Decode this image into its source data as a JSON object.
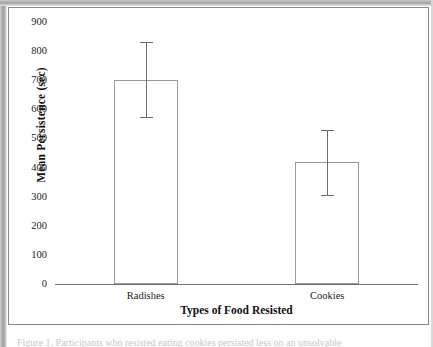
{
  "figure": {
    "caption_clipped": "Figure 1. Participants who resisted eating cookies persisted less on an unsolvable"
  },
  "chart_data": {
    "type": "bar",
    "title": "",
    "xlabel": "Types of Food Resisted",
    "ylabel": "Mean Persistence (sec)",
    "categories": [
      "Radishes",
      "Cookies"
    ],
    "values": [
      700,
      420
    ],
    "errors_low": [
      575,
      305
    ],
    "errors_high": [
      830,
      530
    ],
    "ylim": [
      0,
      900
    ],
    "ytick_values": [
      900,
      800,
      700,
      600,
      500,
      400,
      300,
      200,
      100,
      0
    ],
    "ytick_labels": [
      "900",
      "800",
      "700",
      "600",
      "500",
      "400",
      "300",
      "200",
      "100",
      "0"
    ],
    "grid": false,
    "legend": false,
    "bar_fill": "#ffffff",
    "bar_edge": "#9b9b9b",
    "error_color": "#6a6a6a",
    "axis_color": "#6f6f6f"
  }
}
